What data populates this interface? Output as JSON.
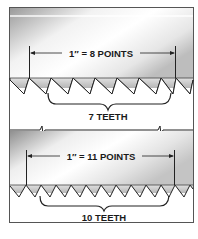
{
  "diagram": {
    "type": "saw-blade-tooth-comparison",
    "panels": [
      {
        "id": "coarse",
        "measurement_label": "1″ = 8 POINTS",
        "teeth_label": "7 TEETH",
        "points_per_inch": 8,
        "teeth_count": 7
      },
      {
        "id": "fine",
        "measurement_label": "1″ = 11 POINTS",
        "teeth_label": "10 TEETH",
        "points_per_inch": 11,
        "teeth_count": 10
      }
    ],
    "colors": {
      "blade_dark": "#9a9a9a",
      "blade_light": "#f4f4f4",
      "line": "#222222",
      "frame": "#555555"
    }
  }
}
